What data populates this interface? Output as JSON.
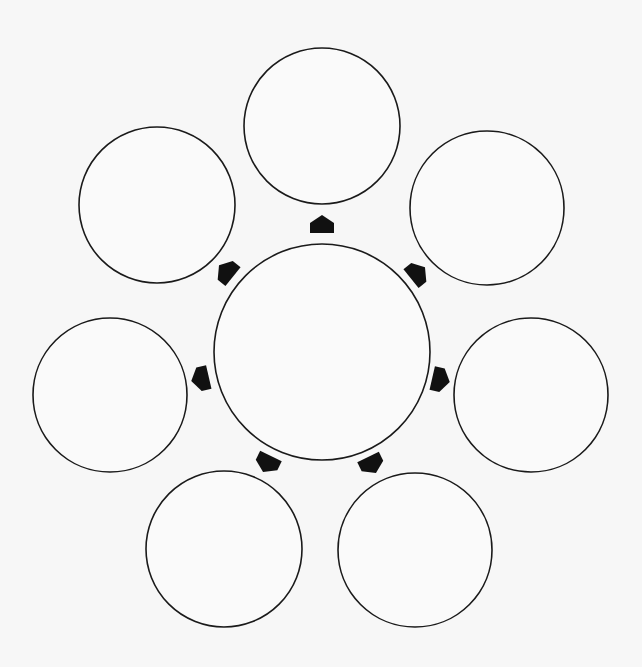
{
  "diagram": {
    "type": "hub-and-spoke radial diagram",
    "colors": {
      "background": "#f7f7f7",
      "circle_fill": "#fafafa",
      "circle_stroke": "#1a1a1a",
      "arrow_fill": "#111111"
    },
    "hub": {
      "id": "center",
      "label": "",
      "cx": 322,
      "cy": 352,
      "r": 108
    },
    "satellites": [
      {
        "id": "top",
        "label": "",
        "cx": 322,
        "cy": 126,
        "r": 78
      },
      {
        "id": "top-right",
        "label": "",
        "cx": 487,
        "cy": 208,
        "r": 77
      },
      {
        "id": "right",
        "label": "",
        "cx": 531,
        "cy": 395,
        "r": 77
      },
      {
        "id": "bottom-right",
        "label": "",
        "cx": 415,
        "cy": 550,
        "r": 77
      },
      {
        "id": "bottom-left",
        "label": "",
        "cx": 224,
        "cy": 549,
        "r": 78
      },
      {
        "id": "left",
        "label": "",
        "cx": 110,
        "cy": 395,
        "r": 77
      },
      {
        "id": "top-left",
        "label": "",
        "cx": 157,
        "cy": 205,
        "r": 78
      }
    ],
    "arrows": [
      {
        "id": "arrow-top",
        "x": 322,
        "y": 224,
        "angle": 0
      },
      {
        "id": "arrow-top-right",
        "x": 418,
        "y": 273,
        "angle": 51
      },
      {
        "id": "arrow-right",
        "x": 441,
        "y": 380,
        "angle": 103
      },
      {
        "id": "arrow-bottom-right",
        "x": 372,
        "y": 465,
        "angle": 154
      },
      {
        "id": "arrow-bottom-left",
        "x": 267,
        "y": 464,
        "angle": 206
      },
      {
        "id": "arrow-left",
        "x": 200,
        "y": 379,
        "angle": 257
      },
      {
        "id": "arrow-top-left",
        "x": 226,
        "y": 271,
        "angle": 309
      }
    ]
  }
}
